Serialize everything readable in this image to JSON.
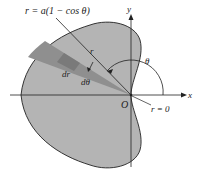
{
  "figure": {
    "curve_label": "r = a(1 − cos θ)",
    "radius_label": "r",
    "dr_label": "dr",
    "dtheta_label": "dθ",
    "theta_label": "θ",
    "origin_label": "O",
    "r_zero_label": "r = 0",
    "x_axis_label": "x",
    "y_axis_label": "y",
    "colors": {
      "cardioid_fill": "#b4b4b4",
      "wedge_fill": "#8f8f8f",
      "element_fill": "#7a7a7a",
      "stroke": "#222222",
      "background": "#ffffff"
    }
  }
}
